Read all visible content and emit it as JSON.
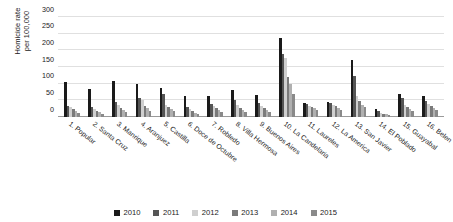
{
  "chart_data": {
    "type": "bar",
    "title": "",
    "xlabel": "",
    "ylabel": "Homicide rate per 100,000",
    "ylabel_lines": [
      "Homicide rate",
      "per 100,000"
    ],
    "ylim": [
      0,
      300
    ],
    "yticks": [
      0,
      50,
      100,
      150,
      200,
      250,
      300
    ],
    "ytick_labels": [
      "0",
      "50",
      "100",
      "150",
      "200",
      "250",
      "300"
    ],
    "grid": true,
    "legend_position": "bottom",
    "categories": [
      "1. Popular",
      "2. Santa Cruz",
      "3. Manrique",
      "4. Aranjuez",
      "5. Castilla",
      "6. Doce de Octubre",
      "7. Robledo",
      "8. Villa Hermosa",
      "9. Buenos Aires",
      "10. La Candelaria",
      "11. Laureles",
      "12. La America",
      "13. San Javier",
      "14. El Poblado",
      "15. Guayabal",
      "16. Belen"
    ],
    "series": [
      {
        "name": "2010",
        "color": "#1a1a1a",
        "values": [
          105,
          84,
          109,
          98,
          88,
          64,
          62,
          81,
          66,
          238,
          41,
          45,
          172,
          23,
          69,
          63
        ]
      },
      {
        "name": "2011",
        "color": "#555555",
        "values": [
          33,
          29,
          44,
          56,
          68,
          30,
          39,
          50,
          42,
          188,
          39,
          41,
          124,
          17,
          58,
          49
        ]
      },
      {
        "name": "2012",
        "color": "#cfcfcf",
        "values": [
          29,
          24,
          36,
          50,
          35,
          24,
          34,
          37,
          33,
          176,
          34,
          35,
          64,
          13,
          36,
          40
        ]
      },
      {
        "name": "2013",
        "color": "#7a7a7a",
        "values": [
          25,
          19,
          28,
          33,
          31,
          19,
          27,
          26,
          27,
          121,
          31,
          33,
          49,
          10,
          30,
          33
        ]
      },
      {
        "name": "2014",
        "color": "#b0b0b0",
        "values": [
          18,
          14,
          22,
          26,
          25,
          13,
          20,
          22,
          21,
          99,
          26,
          27,
          37,
          8,
          23,
          27
        ]
      },
      {
        "name": "2015",
        "color": "#8a8a8a",
        "values": [
          12,
          9,
          16,
          19,
          17,
          9,
          15,
          16,
          15,
          70,
          21,
          22,
          30,
          6,
          17,
          20
        ]
      }
    ]
  }
}
